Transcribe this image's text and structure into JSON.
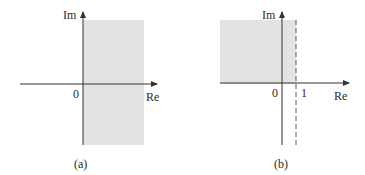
{
  "diagram": {
    "panels": [
      {
        "id": "a",
        "caption": "(a)",
        "axis_labels": {
          "imag": "Im",
          "real": "Re"
        },
        "origin_label": "0",
        "shaded_region": "Re ≥ 0 (right half-plane)",
        "marks": []
      },
      {
        "id": "b",
        "caption": "(b)",
        "axis_labels": {
          "imag": "Im",
          "real": "Re"
        },
        "origin_label": "0",
        "shaded_region": "Re < 1, Im ≥ 0 (upper-left quadrant region)",
        "marks": [
          {
            "label": "1",
            "style": "dashed vertical line at Re = 1"
          }
        ]
      }
    ],
    "colors": {
      "shade": "#e3e3e3",
      "axis": "#333333",
      "text": "#2a2a2a"
    }
  }
}
